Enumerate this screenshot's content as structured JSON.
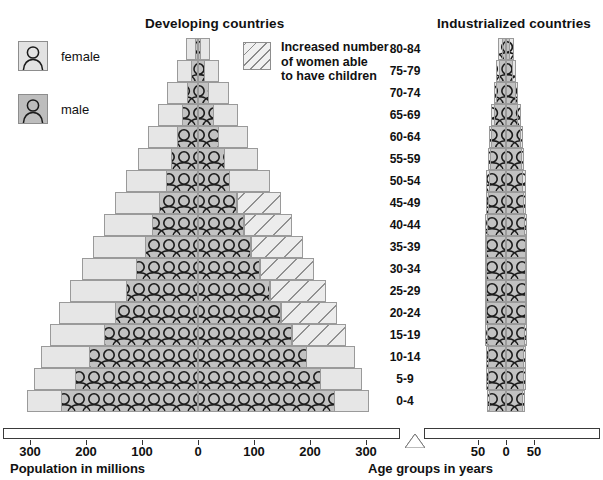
{
  "titles": {
    "developing": "Developing countries",
    "industrialized": "Industrialized countries"
  },
  "legend": {
    "female_label": "female",
    "male_label": "male",
    "female_icon": "person-icon",
    "male_icon": "person-icon",
    "hatch_icon": "hatch-swatch",
    "hatch_label": "Increased number\nof women able\nto have children"
  },
  "axes": {
    "left_caption": "Population in millions",
    "right_caption": "Age groups in years",
    "left_ticks": [
      "300",
      "200",
      "100",
      "0",
      "100",
      "200",
      "300"
    ],
    "right_ticks": [
      "50",
      "0",
      "50"
    ]
  },
  "age_groups": [
    "80-84",
    "75-79",
    "70-74",
    "65-69",
    "60-64",
    "55-59",
    "50-54",
    "45-49",
    "40-44",
    "35-39",
    "30-34",
    "25-29",
    "20-24",
    "15-19",
    "10-14",
    "5-9",
    "0-4"
  ],
  "colors": {
    "outer": "#e6e6e6",
    "inner": "#c2c2c2",
    "hatch_line": "#909090",
    "stroke": "#9a9a9a",
    "axis": "#3a3a3a",
    "text": "#111111"
  },
  "chart_data": {
    "type": "bar",
    "xlabel": "Population in millions",
    "ylabel": "Age groups in years",
    "grid": false,
    "legend_position": "top-left",
    "orientation": "horizontal-diverging",
    "categories": [
      "80-84",
      "75-79",
      "70-74",
      "65-69",
      "60-64",
      "55-59",
      "50-54",
      "45-49",
      "40-44",
      "35-39",
      "30-34",
      "25-29",
      "20-24",
      "15-19",
      "10-14",
      "5-9",
      "0-4"
    ],
    "panels": [
      {
        "name": "Developing countries",
        "xlim": [
          -300,
          300
        ],
        "xticks": [
          -300,
          -200,
          -100,
          0,
          100,
          200,
          300
        ],
        "xticklabels": [
          "300",
          "200",
          "100",
          "0",
          "100",
          "200",
          "300"
        ],
        "units": "millions",
        "series": [
          {
            "name": "male current",
            "side": "left",
            "layer": "inner",
            "values": [
              6,
              13,
              20,
              28,
              38,
              48,
              58,
              70,
              82,
              95,
              110,
              128,
              148,
              168,
              195,
              220,
              245
            ]
          },
          {
            "name": "female current",
            "side": "right",
            "layer": "inner",
            "values": [
              6,
              13,
              20,
              28,
              38,
              48,
              58,
              70,
              82,
              95,
              110,
              128,
              148,
              168,
              195,
              220,
              245
            ]
          },
          {
            "name": "male projected",
            "side": "left",
            "layer": "outer",
            "values": [
              22,
              38,
              55,
              72,
              90,
              108,
              128,
              148,
              168,
              188,
              208,
              228,
              248,
              265,
              280,
              292,
              305
            ]
          },
          {
            "name": "female projected",
            "side": "right",
            "layer": "outer",
            "values": [
              22,
              38,
              55,
              72,
              90,
              108,
              128,
              148,
              168,
              188,
              208,
              228,
              248,
              265,
              280,
              292,
              305
            ]
          },
          {
            "name": "increased women able to have children",
            "side": "right",
            "layer": "hatch",
            "applies_to": [
              "45-49",
              "40-44",
              "35-39",
              "30-34",
              "25-29",
              "20-24",
              "15-19"
            ],
            "from_values": [
              70,
              82,
              95,
              110,
              128,
              148,
              168
            ],
            "to_values": [
              148,
              168,
              188,
              208,
              228,
              248,
              265
            ]
          }
        ]
      },
      {
        "name": "Industrialized countries",
        "xlim": [
          -80,
          80
        ],
        "xticks": [
          -50,
          0,
          50
        ],
        "xticklabels": [
          "50",
          "0",
          "50"
        ],
        "units": "millions",
        "series": [
          {
            "name": "male current",
            "side": "left",
            "layer": "inner",
            "values": [
              8,
              13,
              18,
              22,
              26,
              29,
              31,
              33,
              34,
              35,
              36,
              36,
              35,
              34,
              33,
              32,
              31
            ]
          },
          {
            "name": "female current",
            "side": "right",
            "layer": "inner",
            "values": [
              8,
              13,
              18,
              22,
              26,
              29,
              31,
              33,
              34,
              35,
              36,
              36,
              35,
              34,
              33,
              32,
              31
            ]
          },
          {
            "name": "male projected",
            "side": "left",
            "layer": "outer",
            "values": [
              14,
              18,
              22,
              26,
              30,
              33,
              35,
              36,
              37,
              38,
              38,
              38,
              38,
              37,
              36,
              35,
              34
            ]
          },
          {
            "name": "female projected",
            "side": "right",
            "layer": "outer",
            "values": [
              14,
              18,
              22,
              26,
              30,
              33,
              35,
              36,
              37,
              38,
              38,
              38,
              38,
              37,
              36,
              35,
              34
            ]
          }
        ]
      }
    ]
  }
}
